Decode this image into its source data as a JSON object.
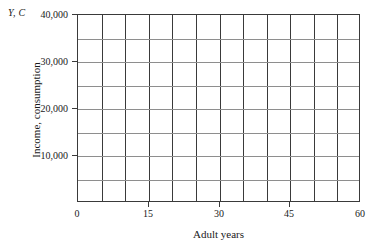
{
  "chart_data": {
    "type": "line",
    "title": "",
    "subtitle": "",
    "xlabel": "Adult years",
    "ylabel": "Income, consumption",
    "axis_corner_label": "Y, C",
    "xlim": [
      0,
      60
    ],
    "ylim": [
      0,
      40000
    ],
    "grid": true,
    "legend": null,
    "annotations": [],
    "series": [],
    "x_ticks": [
      {
        "value": 0,
        "label": "0"
      },
      {
        "value": 15,
        "label": "15"
      },
      {
        "value": 30,
        "label": "30"
      },
      {
        "value": 45,
        "label": "45"
      },
      {
        "value": 60,
        "label": "60"
      }
    ],
    "y_ticks": [
      {
        "value": 10000,
        "label": "10,000"
      },
      {
        "value": 20000,
        "label": "20,000"
      },
      {
        "value": 30000,
        "label": "30,000"
      },
      {
        "value": 40000,
        "label": "40,000"
      }
    ],
    "x_gridlines": [
      0,
      5,
      10,
      15,
      20,
      25,
      30,
      35,
      40,
      45,
      50,
      55,
      60
    ],
    "y_gridlines": [
      0,
      5000,
      10000,
      15000,
      20000,
      25000,
      30000,
      35000,
      40000
    ],
    "colors": {
      "background": "#ffffff",
      "vertical_grid": "#3a3a3a",
      "horizontal_grid": "#8e8e8e",
      "axis": "#3a3a3a",
      "text": "#1a1a1a"
    }
  }
}
